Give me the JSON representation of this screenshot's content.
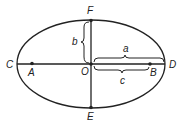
{
  "diagram": {
    "points": {
      "F": "F",
      "E": "E",
      "C": "C",
      "D": "D",
      "O": "O",
      "A": "A",
      "B": "B"
    },
    "parameters": {
      "semi_minor": "b",
      "semi_major": "a",
      "focal_distance": "c"
    },
    "colors": {
      "stroke": "#222222",
      "background": "#ffffff"
    }
  }
}
